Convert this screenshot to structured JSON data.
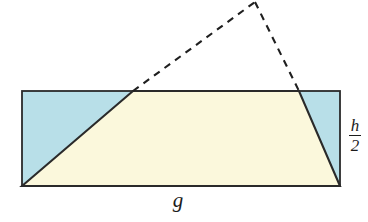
{
  "figure": {
    "canvas": {
      "width": 368,
      "height": 222
    },
    "colors": {
      "background": "#ffffff",
      "blue_fill": "#b8dfe8",
      "cream_fill": "#fbf8dc",
      "stroke": "#2a2a2a",
      "dashed_stroke": "#1f1f1f",
      "label_color": "#1c1c1c"
    },
    "rectangle": {
      "x": 22,
      "y": 91,
      "width": 318,
      "height": 95,
      "label": "bounding-rectangle"
    },
    "trapezoid": {
      "label": "trapezoid",
      "fill": "#fbf8dc",
      "points": "22,186 133,91 299,91 340,186"
    },
    "triangle_left": {
      "label": "left-blue-triangle",
      "fill": "#b8dfe8",
      "points": "22,91 133,91 22,186"
    },
    "triangle_right": {
      "label": "right-blue-triangle",
      "fill": "#b8dfe8",
      "points": "299,91 340,91 340,186"
    },
    "dashed_apex": {
      "x": 255,
      "y": 2
    },
    "dashed_left_line": {
      "x1": 133,
      "y1": 91,
      "x2": 255,
      "y2": 2
    },
    "dashed_right_line": {
      "x1": 255,
      "y1": 2,
      "x2": 299,
      "y2": 91
    }
  },
  "labels": {
    "base": "g",
    "height_numerator": "h",
    "height_denominator": "2",
    "height_combined": "h/2"
  },
  "chart_data": {
    "type": "diagram",
    "annotations": [
      {
        "name": "base-label",
        "text": "g",
        "position": "bottom-center"
      },
      {
        "name": "height-label",
        "text": "h/2",
        "position": "right-middle"
      }
    ]
  }
}
